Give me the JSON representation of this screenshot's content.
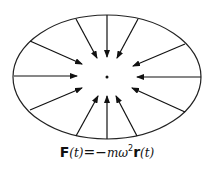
{
  "diagram": {
    "ellipse": {
      "cx": 107,
      "cy": 77,
      "rx": 94,
      "ry": 62,
      "stroke": "#222222"
    },
    "center_dot": {
      "x": 107,
      "y": 77,
      "r": 1.5
    },
    "arrows": [
      {
        "x1": 107,
        "y1": 15,
        "x2": 107,
        "y2": 57
      },
      {
        "x1": 76,
        "y1": 19,
        "x2": 97,
        "y2": 58
      },
      {
        "x1": 138,
        "y1": 19,
        "x2": 117,
        "y2": 58
      },
      {
        "x1": 30,
        "y1": 41,
        "x2": 82,
        "y2": 64
      },
      {
        "x1": 185,
        "y1": 44,
        "x2": 133,
        "y2": 66
      },
      {
        "x1": 14,
        "y1": 76,
        "x2": 77,
        "y2": 76
      },
      {
        "x1": 201,
        "y1": 77,
        "x2": 137,
        "y2": 77
      },
      {
        "x1": 30,
        "y1": 110,
        "x2": 82,
        "y2": 88
      },
      {
        "x1": 185,
        "y1": 112,
        "x2": 132,
        "y2": 88
      },
      {
        "x1": 76,
        "y1": 136,
        "x2": 98,
        "y2": 96
      },
      {
        "x1": 137,
        "y1": 136,
        "x2": 116,
        "y2": 96
      },
      {
        "x1": 107,
        "y1": 139,
        "x2": 107,
        "y2": 96
      }
    ]
  },
  "formula": {
    "F": "F",
    "t1": "(t)",
    "eq": "=−",
    "m": "m",
    "omega": "ω",
    "sq": "2",
    "r": "r",
    "t2": "(t)",
    "full_text": "F(t)=−mω²r(t)"
  }
}
